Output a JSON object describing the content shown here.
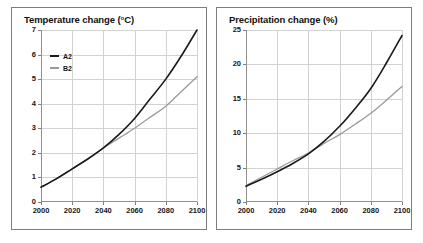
{
  "figure": {
    "background": "#ffffff",
    "panel_border_color": "#7d7d7d",
    "grid_color": "#d2d2d2",
    "axis_color": "#909090"
  },
  "series_colors": {
    "A2": "#1a1a1a",
    "B2": "#9a9a9a"
  },
  "legend": {
    "entries": [
      {
        "label": "A2",
        "color": "#1a1a1a"
      },
      {
        "label": "B2",
        "color": "#9a9a9a"
      }
    ]
  },
  "chart_data": [
    {
      "type": "line",
      "title": "Temperature change (°C)",
      "xlabel": "",
      "ylabel": "",
      "xlim": [
        2000,
        2100
      ],
      "ylim": [
        0,
        7
      ],
      "grid": true,
      "legend_position": "upper-left",
      "xticks": [
        2000,
        2020,
        2040,
        2060,
        2080,
        2100
      ],
      "xticklabels": [
        "2000",
        "2020",
        "2040",
        "2060",
        "2080",
        "2100"
      ],
      "yticks": [
        0,
        1,
        2,
        3,
        4,
        5,
        6,
        7
      ],
      "yticklabels": [
        "0",
        "1",
        "2",
        "3",
        "4",
        "5",
        "6",
        "7"
      ],
      "x": [
        2000,
        2010,
        2020,
        2030,
        2040,
        2050,
        2060,
        2070,
        2080,
        2090,
        2100
      ],
      "series": [
        {
          "name": "A2",
          "color": "#1a1a1a",
          "values": [
            0.6,
            0.95,
            1.35,
            1.75,
            2.2,
            2.75,
            3.4,
            4.2,
            5.0,
            5.95,
            7.0
          ]
        },
        {
          "name": "B2",
          "color": "#9a9a9a",
          "values": [
            0.6,
            0.95,
            1.35,
            1.75,
            2.2,
            2.6,
            3.0,
            3.45,
            3.9,
            4.5,
            5.1
          ]
        }
      ]
    },
    {
      "type": "line",
      "title": "Precipitation change (%)",
      "xlabel": "",
      "ylabel": "",
      "xlim": [
        2000,
        2100
      ],
      "ylim": [
        0,
        25
      ],
      "grid": true,
      "legend_position": "upper-left",
      "xticks": [
        2000,
        2020,
        2040,
        2060,
        2080,
        2100
      ],
      "xticklabels": [
        "2000",
        "2020",
        "2040",
        "2060",
        "2080",
        "2100"
      ],
      "yticks": [
        0,
        5,
        10,
        15,
        20,
        25
      ],
      "yticklabels": [
        "0",
        "5",
        "10",
        "15",
        "20",
        "25"
      ],
      "x": [
        2000,
        2010,
        2020,
        2030,
        2040,
        2050,
        2060,
        2070,
        2080,
        2090,
        2100
      ],
      "series": [
        {
          "name": "A2",
          "color": "#1a1a1a",
          "values": [
            2.3,
            3.3,
            4.4,
            5.6,
            7.0,
            8.8,
            11.0,
            13.6,
            16.5,
            20.2,
            24.2
          ]
        },
        {
          "name": "B2",
          "color": "#9a9a9a",
          "values": [
            2.4,
            3.6,
            4.8,
            6.0,
            7.1,
            8.5,
            9.8,
            11.3,
            12.9,
            14.8,
            16.8
          ]
        }
      ]
    }
  ]
}
